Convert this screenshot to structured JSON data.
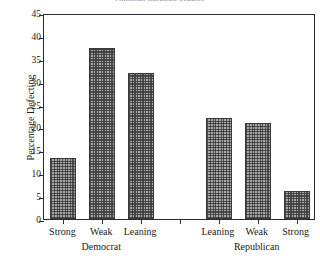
{
  "chart_data": {
    "type": "bar",
    "title": "National Election Studies",
    "xlabel": "",
    "ylabel": "Percentage Defecting",
    "ylim": [
      0,
      45
    ],
    "yticks": [
      0,
      5,
      10,
      15,
      20,
      25,
      30,
      35,
      40,
      45
    ],
    "ytick_labels": [
      "0",
      "5",
      "10",
      "15",
      "20",
      "25",
      "30",
      "35",
      "40",
      "45"
    ],
    "grid": false,
    "legend": "none",
    "categories": [
      "Strong",
      "Weak",
      "Leaning",
      "",
      "Leaning",
      "Weak",
      "Strong"
    ],
    "values": [
      13.4,
      37.3,
      31.9,
      null,
      22.0,
      20.9,
      6.2
    ],
    "groups": [
      {
        "name": "Democrat",
        "categories": [
          "Strong",
          "Weak",
          "Leaning"
        ],
        "values": [
          13.4,
          37.3,
          31.9
        ]
      },
      {
        "name": "Republican",
        "categories": [
          "Leaning",
          "Weak",
          "Strong"
        ],
        "values": [
          22.0,
          20.9,
          6.2
        ]
      }
    ],
    "bar_fill_color": "#a8a8a8",
    "bar_edge_color": "#3a3a3a",
    "axis_color": "#2b2b2b",
    "background_color": "#ffffff"
  }
}
